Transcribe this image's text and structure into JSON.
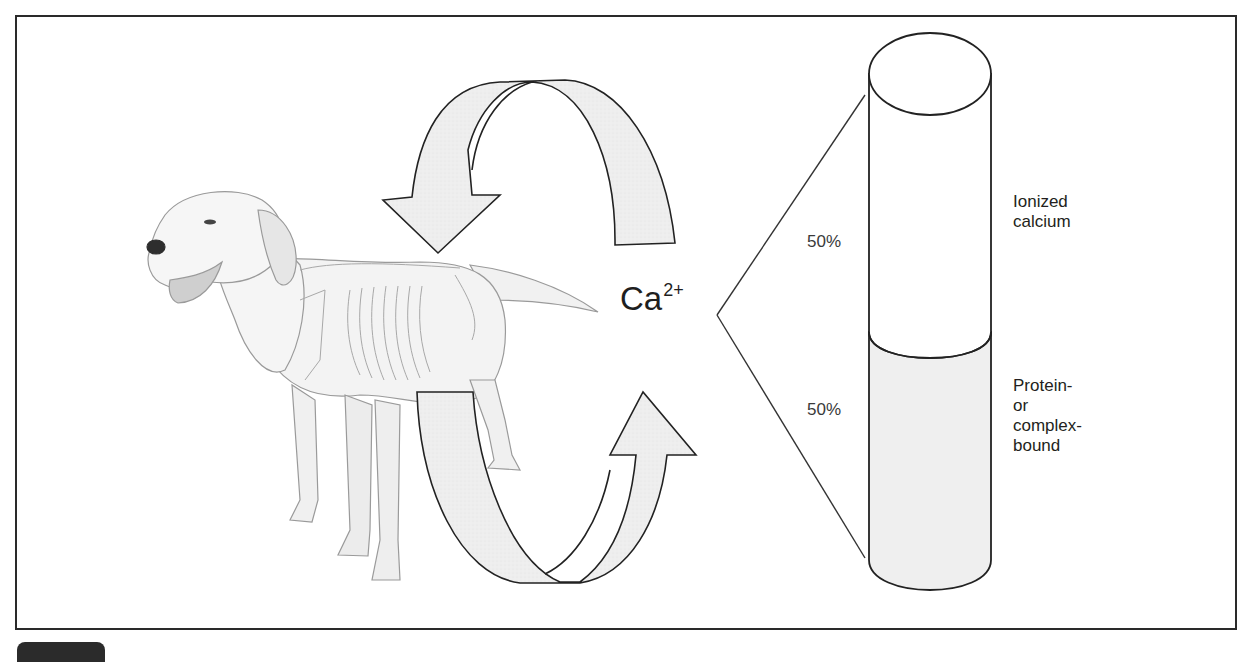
{
  "figure": {
    "type": "calcium distribution diagram",
    "subject_illustration": "dog with skeleton overlay",
    "ion_symbol": "Ca",
    "ion_charge": "2+",
    "cycle_arrows": [
      "top arrow (curving down toward body)",
      "bottom arrow (curving up from body)"
    ],
    "cylinder": {
      "segments": [
        {
          "percent": "50%",
          "label_lines": [
            "Ionized",
            "calcium"
          ],
          "fill": "#ffffff"
        },
        {
          "percent": "50%",
          "label_lines": [
            "Protein-",
            "or",
            "complex-",
            "bound"
          ],
          "fill": "#efefef"
        }
      ]
    },
    "colors": {
      "outline": "#2a2a2a",
      "arrow_fill": "#ececec",
      "bound_fill": "#efefef",
      "frame": "#2a2a2a"
    }
  }
}
